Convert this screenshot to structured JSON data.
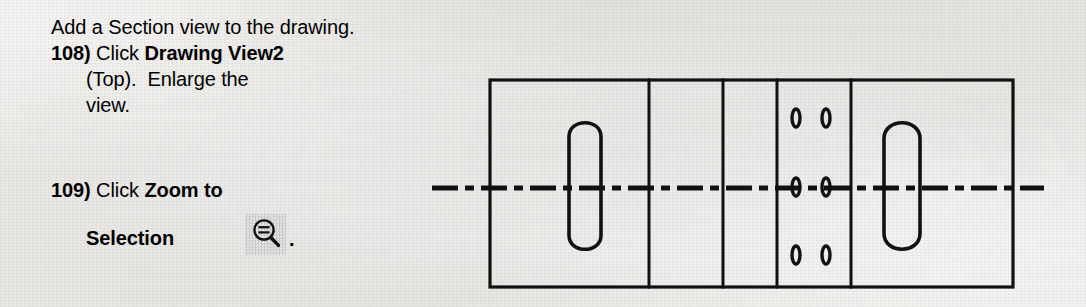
{
  "page": {
    "background_color": "#f3f2f0",
    "ink_color": "#111111"
  },
  "instructions": {
    "intro": "Add a Section view to the drawing.",
    "steps": [
      {
        "number": "108)",
        "lines": [
          {
            "normal": "Click ",
            "bold": "Drawing View2"
          },
          {
            "normal": "(Top).  Enlarge the",
            "bold": ""
          },
          {
            "normal": "view.",
            "bold": ""
          }
        ]
      },
      {
        "number": "109)",
        "lines": [
          {
            "normal": "Click ",
            "bold": "Zoom to"
          },
          {
            "normal": "",
            "bold": "Selection"
          }
        ],
        "icon": {
          "name": "zoom-to-selection-icon",
          "label": "Zoom to Selection",
          "trailing_punctuation": "."
        }
      }
    ]
  },
  "drawing": {
    "title": "Top view of plate with slots and holes",
    "line_color": "#111111",
    "outline": {
      "x": 490,
      "y": 80,
      "width": 523,
      "height": 207
    },
    "vertical_dividers": [
      649,
      723,
      777,
      851
    ],
    "centerline": {
      "y": 188,
      "x_start": 432,
      "x_end": 1044,
      "style": "dash-dot",
      "label": "horizontal section centerline"
    },
    "slots": [
      {
        "name": "left-slot",
        "cx": 585,
        "cy": 186,
        "rx": 16,
        "ry": 64
      },
      {
        "name": "right-slot",
        "cx": 902,
        "cy": 186,
        "rx": 18,
        "ry": 64
      }
    ],
    "holes": [
      {
        "cx": 796,
        "cy": 118
      },
      {
        "cx": 826,
        "cy": 118
      },
      {
        "cx": 796,
        "cy": 187
      },
      {
        "cx": 826,
        "cy": 187
      },
      {
        "cx": 796,
        "cy": 255
      },
      {
        "cx": 826,
        "cy": 255
      }
    ],
    "hole_size": {
      "rx": 4,
      "ry": 9
    }
  }
}
